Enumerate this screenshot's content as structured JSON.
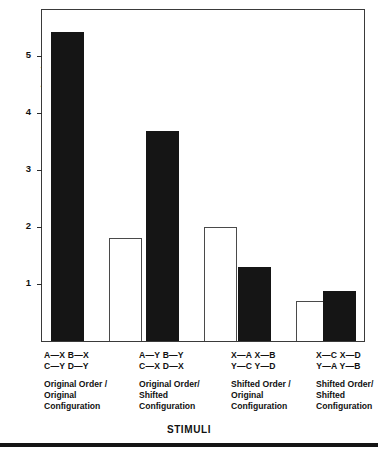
{
  "chart_data": {
    "type": "bar",
    "title": "",
    "xlabel": "STIMULI",
    "ylabel": "MEAN AMPLITUDE EYELID CLOSURE (mm)",
    "ylim": [
      0,
      5.8
    ],
    "yticks": [
      1,
      2,
      3,
      4,
      5
    ],
    "ytick_labels": [
      "1",
      "2",
      "3",
      "4",
      "5"
    ],
    "grid": false,
    "legend": "none",
    "categories": [
      "A—X C—Y",
      "B—X D—Y",
      "A—Y C—X",
      "B—Y D—X",
      "X—A Y—C",
      "X—B Y—D",
      "X—C Y—A",
      "X—D Y—B"
    ],
    "values": [
      5.42,
      1.8,
      3.68,
      2.0,
      1.3,
      0.7,
      0.88,
      0.72
    ],
    "bar_styles": [
      "filled",
      "open",
      "filled",
      "open",
      "filled",
      "open",
      "filled",
      "open"
    ],
    "groups": [
      {
        "code_line1": "A—X  B—X",
        "code_line2": "C—Y  D—Y",
        "desc_line1": "Original Order /",
        "desc_line2": "Original",
        "desc_line3": "Configuration",
        "bars": [
          {
            "label": "A—X C—Y",
            "value": 5.42,
            "style": "filled"
          },
          {
            "label": "B—X D—Y",
            "value": 1.8,
            "style": "open"
          }
        ]
      },
      {
        "code_line1": "A—Y  B—Y",
        "code_line2": "C—X  D—X",
        "desc_line1": "Original Order/",
        "desc_line2": "Shifted",
        "desc_line3": "Configuration",
        "bars": [
          {
            "label": "A—Y C—X",
            "value": 3.68,
            "style": "filled"
          },
          {
            "label": "B—Y D—X",
            "value": 2.0,
            "style": "open"
          }
        ]
      },
      {
        "code_line1": "X—A  X—B",
        "code_line2": "Y—C  Y—D",
        "desc_line1": "Shifted Order /",
        "desc_line2": "Original",
        "desc_line3": "Configuration",
        "bars": [
          {
            "label": "X—A Y—C",
            "value": 1.3,
            "style": "filled"
          },
          {
            "label": "X—B Y—D",
            "value": 0.7,
            "style": "open"
          }
        ]
      },
      {
        "code_line1": "X—C  X—D",
        "code_line2": "Y—A  Y—B",
        "desc_line1": "Shifted Order/",
        "desc_line2": "Shifted",
        "desc_line3": "Configuration",
        "bars": [
          {
            "label": "X—C Y—A",
            "value": 0.88,
            "style": "filled"
          },
          {
            "label": "X—D Y—B",
            "value": 0.72,
            "style": "open"
          }
        ]
      }
    ]
  },
  "colors": {
    "filled_bar": "#151515",
    "open_bar_border": "#4a4a4a",
    "axis": "#3a3a3a",
    "background": "#ffffff",
    "text": "#111111"
  }
}
